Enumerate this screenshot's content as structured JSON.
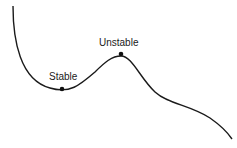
{
  "diagram": {
    "title": "",
    "curve_color": "#1a1a1a",
    "points": [
      {
        "label": "Stable",
        "x": 62,
        "y": 89,
        "label_x": 49,
        "label_y": 80
      },
      {
        "label": "Unstable",
        "x": 121,
        "y": 54,
        "label_x": 99,
        "label_y": 46
      }
    ]
  }
}
